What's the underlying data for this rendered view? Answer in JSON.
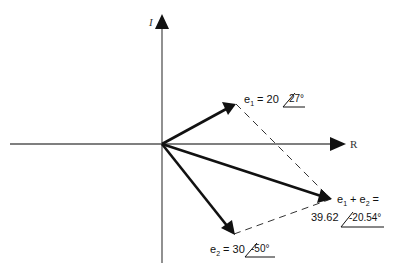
{
  "diagram": {
    "type": "phasor-addition",
    "axes": {
      "horizontal_label": "R",
      "vertical_label": "I"
    },
    "phasors": [
      {
        "name": "e1",
        "symbol": "e",
        "subscript": "1",
        "eq": "= 20",
        "magnitude": "20",
        "angle": "27°"
      },
      {
        "name": "e2",
        "symbol": "e",
        "subscript": "2",
        "eq": "= 30",
        "magnitude": "30",
        "angle": "-50°"
      }
    ],
    "sum": {
      "label_prefix": "e",
      "sub1": "1",
      "plus": "+ e",
      "sub2": "2",
      "eq": "=",
      "magnitude": "39.62",
      "angle": "-20.54°"
    },
    "colors": {
      "axis": "#555555",
      "vector": "#111111",
      "dashed": "#333333"
    }
  }
}
